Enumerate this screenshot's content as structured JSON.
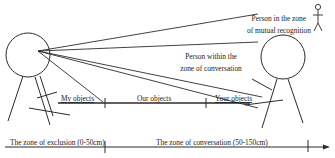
{
  "diagram": {
    "type": "proxemics-zones",
    "labels": {
      "mutual_recognition_line1": "Person in the zone",
      "mutual_recognition_line2": "of mutual recognition",
      "conversation_person_line1": "Person within the",
      "conversation_person_line2": "zone of conversation",
      "my_objects": "My objects",
      "our_objects": "Our objects",
      "your_objects": "Your objects",
      "zone_exclusion": "The zone of exclusion (0-50cm)",
      "zone_conversation": "The zone of conversation (50-150cm)"
    },
    "colors": {
      "stroke": "#2b2b2b",
      "text": "#1a1a1a",
      "background": "#ffffff"
    }
  }
}
